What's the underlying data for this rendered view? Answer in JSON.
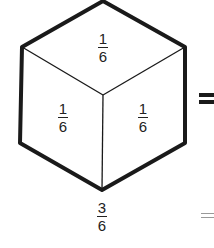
{
  "diagram": {
    "shape": "cube (hexagon split into three rhombic faces)",
    "faces": {
      "top": {
        "numerator": "1",
        "denominator": "6"
      },
      "left": {
        "numerator": "1",
        "denominator": "6"
      },
      "right": {
        "numerator": "1",
        "denominator": "6"
      }
    },
    "total": {
      "numerator": "3",
      "denominator": "6"
    },
    "symbols": {
      "equals_large": "=",
      "equals_small": "="
    },
    "colors": {
      "stroke": "#1a1a1a",
      "text": "#222222",
      "background": "#ffffff",
      "faint": "#999999"
    }
  }
}
